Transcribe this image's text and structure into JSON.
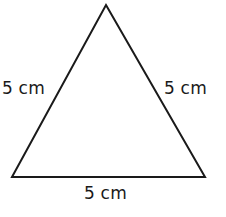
{
  "figure": {
    "name": "equilateral-triangle-diagram",
    "background_color": "#ffffff",
    "stroke_color": "#1a1a1a",
    "text_color": "#1a1a1a",
    "width": 226,
    "height": 217
  },
  "shape": {
    "type": "triangle",
    "classification": "equilateral",
    "vertices": {
      "apex": [
        106,
        5
      ],
      "bottom_left": [
        12,
        177
      ],
      "bottom_right": [
        205,
        177
      ]
    },
    "stroke_width": 2,
    "fill": "none",
    "points_attr": "106,5 205,177 12,177"
  },
  "labels": {
    "left_side": "5 cm",
    "right_side": "5 cm",
    "base": "5 cm"
  },
  "caption": {
    "clipped_text": ""
  }
}
